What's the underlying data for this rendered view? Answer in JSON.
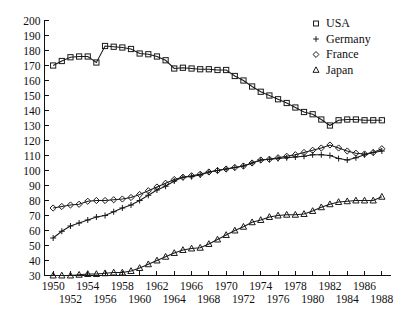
{
  "chart_data": {
    "type": "line",
    "title": "",
    "subtitle": "",
    "xlabel": "",
    "ylabel": "",
    "xlim": [
      1949,
      1989
    ],
    "ylim": [
      30,
      200
    ],
    "grid": false,
    "legend_position": "top-right",
    "y_ticks": [
      30,
      40,
      50,
      60,
      70,
      80,
      90,
      100,
      110,
      120,
      130,
      140,
      150,
      160,
      170,
      180,
      190,
      200
    ],
    "x_ticks": [
      1950,
      1952,
      1954,
      1956,
      1958,
      1960,
      1962,
      1964,
      1966,
      1968,
      1970,
      1972,
      1974,
      1976,
      1978,
      1980,
      1982,
      1984,
      1986,
      1988
    ],
    "x_tick_rows": {
      "upper": [
        1950,
        1954,
        1958,
        1962,
        1966,
        1970,
        1974,
        1978,
        1982,
        1986
      ],
      "lower": [
        1952,
        1956,
        1960,
        1964,
        1968,
        1972,
        1976,
        1980,
        1984,
        1988
      ]
    },
    "x": [
      1950,
      1951,
      1952,
      1953,
      1954,
      1955,
      1956,
      1957,
      1958,
      1959,
      1960,
      1961,
      1962,
      1963,
      1964,
      1965,
      1966,
      1967,
      1968,
      1969,
      1970,
      1971,
      1972,
      1973,
      1974,
      1975,
      1976,
      1977,
      1978,
      1979,
      1980,
      1981,
      1982,
      1983,
      1984,
      1985,
      1986,
      1987,
      1988
    ],
    "series": [
      {
        "name": "USA",
        "marker": "square",
        "values": [
          170,
          173,
          175.5,
          176,
          176,
          172,
          183,
          182.5,
          182,
          181,
          178,
          177.5,
          176,
          173.5,
          168,
          168.5,
          168,
          167.5,
          167.5,
          167,
          167,
          163,
          160,
          156,
          152.5,
          150,
          147.5,
          145,
          142,
          139,
          137.5,
          134,
          130,
          133.5,
          134,
          134,
          133.5,
          133.5,
          133.5
        ]
      },
      {
        "name": "Germany",
        "marker": "plus",
        "values": [
          55,
          59.5,
          63,
          65,
          67,
          69,
          70,
          72.5,
          75,
          77,
          80,
          83.5,
          87,
          89.5,
          93,
          95.5,
          96,
          97,
          99,
          100,
          101,
          102,
          103,
          105,
          107,
          107.5,
          108,
          108.5,
          109,
          109.5,
          110.5,
          110.5,
          110,
          108,
          107,
          108.5,
          110.5,
          112,
          113
        ]
      },
      {
        "name": "France",
        "marker": "diamond",
        "values": [
          75,
          76,
          77,
          77.5,
          79.5,
          80,
          80,
          80.5,
          81,
          82,
          84,
          86.5,
          89,
          91.5,
          94,
          95.5,
          96.5,
          97.5,
          99,
          100,
          101,
          102,
          103,
          105,
          107,
          107.5,
          108.5,
          109.5,
          110.5,
          112,
          113.5,
          115,
          117,
          115,
          113,
          111.5,
          111,
          112,
          114.5
        ]
      },
      {
        "name": "Japan",
        "marker": "triangle",
        "values": [
          30,
          30,
          30,
          30.5,
          31,
          31,
          31.5,
          32,
          32,
          33,
          35,
          37.5,
          40,
          42.5,
          45,
          47,
          48,
          48.5,
          51,
          54,
          57,
          60,
          62.5,
          65.5,
          67,
          69,
          70,
          70.5,
          70.5,
          71,
          73,
          75.5,
          77.5,
          79,
          79.5,
          80,
          80,
          80,
          82.5
        ]
      }
    ]
  },
  "legend": {
    "items": [
      {
        "label": "USA",
        "marker": "square"
      },
      {
        "label": "Germany",
        "marker": "plus"
      },
      {
        "label": "France",
        "marker": "diamond"
      },
      {
        "label": "Japan",
        "marker": "triangle"
      }
    ]
  }
}
